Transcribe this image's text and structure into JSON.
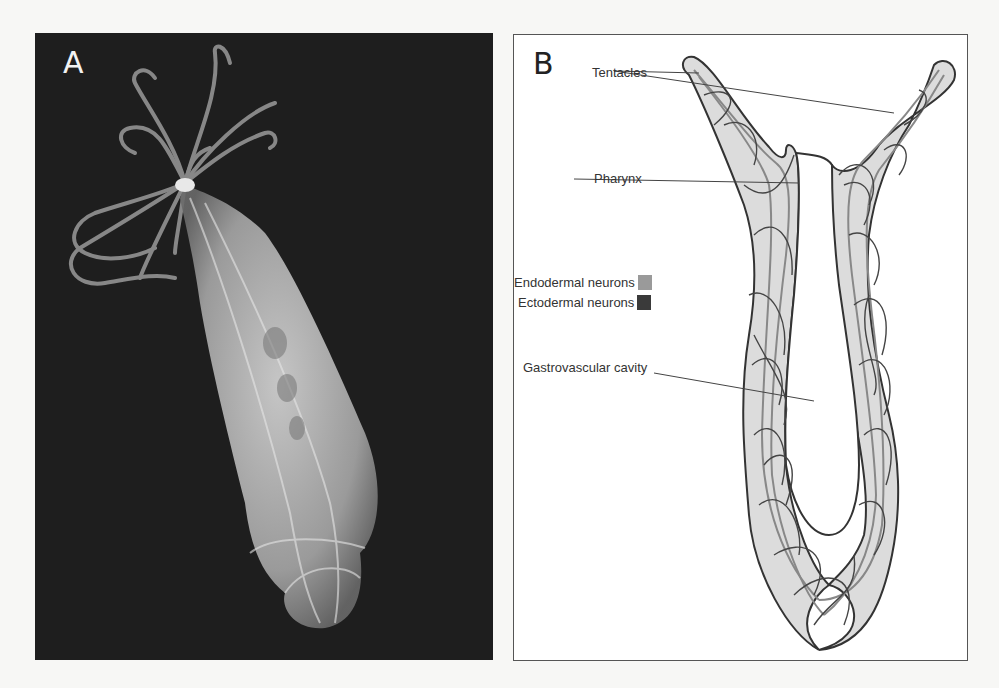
{
  "panels": {
    "a": {
      "label": "A",
      "description": "Photograph of hydra-like polyp on dark background"
    },
    "b": {
      "label": "B",
      "description": "Schematic of neuron network in polyp body"
    }
  },
  "annotations": {
    "tentacles": "Tentacles",
    "pharynx": "Pharynx",
    "gastrovascular_cavity": "Gastrovascular cavity"
  },
  "legend": [
    {
      "label": "Endodermal neurons",
      "color": "#9a9a9a"
    },
    {
      "label": "Ectodermal neurons",
      "color": "#3a3a3a"
    }
  ],
  "colors": {
    "body_fill": "#dcdcdc",
    "outline": "#333333",
    "photo_bg": "#1e1e1e"
  }
}
